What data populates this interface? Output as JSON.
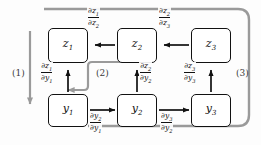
{
  "diagram": {
    "colors": {
      "node_stroke": "#111111",
      "edge": "#111111",
      "backprop_path": "#9a9a9a",
      "background": "#fdfdfd"
    },
    "nodes": [
      {
        "id": "z1",
        "base": "z",
        "sub": "1",
        "x": 48,
        "y": 28,
        "w": 40,
        "h": 35
      },
      {
        "id": "z2",
        "base": "z",
        "sub": "2",
        "x": 117,
        "y": 28,
        "w": 40,
        "h": 35
      },
      {
        "id": "z3",
        "base": "z",
        "sub": "3",
        "x": 191,
        "y": 28,
        "w": 40,
        "h": 35
      },
      {
        "id": "y1",
        "base": "y",
        "sub": "1",
        "x": 48,
        "y": 94,
        "w": 40,
        "h": 33
      },
      {
        "id": "y2",
        "base": "y",
        "sub": "2",
        "x": 117,
        "y": 94,
        "w": 40,
        "h": 33
      },
      {
        "id": "y3",
        "base": "y",
        "sub": "3",
        "x": 191,
        "y": 94,
        "w": 40,
        "h": 33
      }
    ],
    "edges": [
      {
        "id": "z2-to-z1",
        "from": "z2",
        "to": "z1",
        "dir": "left",
        "label": {
          "num_base": "∂z",
          "num_sub": "1",
          "den_base": "∂z",
          "den_sub": "2"
        }
      },
      {
        "id": "z3-to-z2",
        "from": "z3",
        "to": "z2",
        "dir": "left",
        "label": {
          "num_base": "∂z",
          "num_sub": "2",
          "den_base": "∂z",
          "den_sub": "3"
        }
      },
      {
        "id": "y1-to-z1",
        "from": "y1",
        "to": "z1",
        "dir": "up",
        "label": {
          "num_base": "∂z",
          "num_sub": "1",
          "den_base": "∂y",
          "den_sub": "1"
        }
      },
      {
        "id": "y2-to-z2",
        "from": "y2",
        "to": "z2",
        "dir": "up",
        "label": {
          "num_base": "∂z",
          "num_sub": "2",
          "den_base": "∂y",
          "den_sub": "2"
        }
      },
      {
        "id": "y3-to-z3",
        "from": "y3",
        "to": "z3",
        "dir": "up",
        "label": {
          "num_base": "∂z",
          "num_sub": "3",
          "den_base": "∂y",
          "den_sub": "3"
        }
      },
      {
        "id": "y1-to-y2",
        "from": "y1",
        "to": "y2",
        "dir": "right",
        "label": {
          "num_base": "∂y",
          "num_sub": "2",
          "den_base": "∂y",
          "den_sub": "1"
        }
      },
      {
        "id": "y2-to-y3",
        "from": "y2",
        "to": "y3",
        "dir": "right",
        "label": {
          "num_base": "∂y",
          "num_sub": "3",
          "den_base": "∂y",
          "den_sub": "2"
        }
      }
    ],
    "backprop_paths": [
      {
        "id": "path-1",
        "label": "(1)",
        "label_x": 12,
        "label_y": 68
      },
      {
        "id": "path-2",
        "label": "(2)",
        "label_x": 96,
        "label_y": 68
      },
      {
        "id": "path-3",
        "label": "(3)",
        "label_x": 236,
        "label_y": 68
      }
    ]
  }
}
